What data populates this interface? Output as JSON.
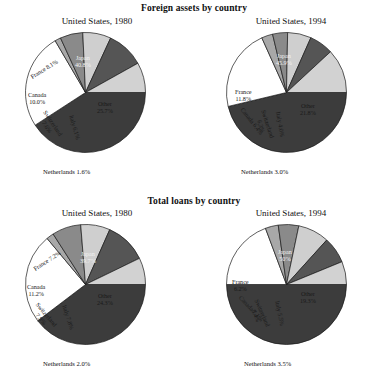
{
  "figure": {
    "panels": [
      {
        "title": "Foreign assets by country",
        "charts": [
          {
            "title": "United States, 1980",
            "netherlands_label": "Netherlands 1.6%"
          },
          {
            "title": "United States, 1994",
            "netherlands_label": "Netherlands 3.0%"
          }
        ]
      },
      {
        "title": "Total loans by country",
        "charts": [
          {
            "title": "United States, 1980",
            "netherlands_label": "Netherlands 2.0%"
          },
          {
            "title": "United States, 1994",
            "netherlands_label": "Netherlands 3.5%"
          }
        ]
      }
    ]
  },
  "colors": {
    "japan": "#3c3c3c",
    "other": "#ffffff",
    "france": "#d2d2d2",
    "canada": "#555555",
    "switzerland": "#cfcfcf",
    "italy": "#8a8a8a",
    "netherlands": "#a8a8a8",
    "stroke": "#1a1a1a",
    "text": "#111111",
    "text_on_dark": "#f2f2f2"
  },
  "chart_data": [
    {
      "type": "pie",
      "title": "United States, 1980",
      "supertitle": "Foreign assets by country",
      "labels": [
        "Japan",
        "Other",
        "Netherlands",
        "Italy",
        "Switzerland",
        "Canada",
        "France"
      ],
      "values": [
        40.8,
        25.7,
        1.6,
        6.1,
        7.6,
        10.0,
        8.1
      ],
      "value_suffix": "%",
      "slice_labels": [
        "Japan\n40.8%",
        "Other\n25.7%",
        "Netherlands 1.6%",
        "Italy 6.1%",
        "Switzerland\n7.6%",
        "Canada\n10.0%",
        "France 8.1%"
      ],
      "legend": "none",
      "start_angle_deg": 0,
      "direction": "clockwise"
    },
    {
      "type": "pie",
      "title": "United States, 1994",
      "supertitle": "Foreign assets by country",
      "labels": [
        "Japan",
        "Other",
        "Netherlands",
        "Italy",
        "Switzerland",
        "Canada",
        "France"
      ],
      "values": [
        45.9,
        21.8,
        3.0,
        4.0,
        6.3,
        6.4,
        11.8
      ],
      "value_suffix": "%",
      "slice_labels": [
        "Japan\n45.9%",
        "Other\n21.8%",
        "Netherlands 3.0%",
        "Italy 4.0%",
        "Switzerland\n6.3%",
        "Canada 6.4%",
        "France\n11.8%"
      ],
      "legend": "none",
      "start_angle_deg": 0,
      "direction": "clockwise"
    },
    {
      "type": "pie",
      "title": "United States, 1980",
      "supertitle": "Total loans by country",
      "labels": [
        "Japan",
        "Other",
        "Netherlands",
        "Italy",
        "Switzerland",
        "Canada",
        "France"
      ],
      "values": [
        39.7,
        24.3,
        2.0,
        7.8,
        7.9,
        11.2,
        7.2
      ],
      "value_suffix": "%",
      "slice_labels": [
        "Japan\n39.7%",
        "Other\n24.3%",
        "Netherlands 2.0%",
        "Italy 7.8%",
        "Switzerland\n7.9%",
        "Canada\n11.2%",
        "France 7.2%"
      ],
      "legend": "none",
      "start_angle_deg": 0,
      "direction": "clockwise"
    },
    {
      "type": "pie",
      "title": "United States, 1994",
      "supertitle": "Total loans by country",
      "labels": [
        "Japan",
        "Other",
        "Netherlands",
        "Italy",
        "Switzerland",
        "Canada",
        "France"
      ],
      "values": [
        50.0,
        19.3,
        3.5,
        5.5,
        8.4,
        7.1,
        6.2
      ],
      "value_suffix": "%",
      "slice_labels": [
        "Japan\n50%",
        "Other\n19.3%",
        "Netherlands 3.5%",
        "Italy 5.5%",
        "Switzerland\n8.4%",
        "Canada 7.1%",
        "France\n6.2%"
      ],
      "legend": "none",
      "start_angle_deg": 0,
      "direction": "clockwise"
    }
  ],
  "labels": {
    "c0": {
      "japan_l1": "Japan",
      "japan_l2": "40.8%",
      "other_l1": "Other",
      "other_l2": "25.7%",
      "france": "France 8.1%",
      "canada_l1": "Canada",
      "canada_l2": "10.0%",
      "switzerland_l1": "Switzerland",
      "switzerland_l2": "7.6%",
      "italy": "Italy 6.1%",
      "netherlands": "Netherlands 1.6%"
    },
    "c1": {
      "japan_l1": "Japan",
      "japan_l2": "45.9%",
      "other_l1": "Other",
      "other_l2": "21.8%",
      "france_l1": "France",
      "france_l2": "11.8%",
      "canada": "Canada 6.4%",
      "switzerland_l1": "Switzerland",
      "switzerland_l2": "6.3%",
      "italy": "Italy 4.0%",
      "netherlands": "Netherlands 3.0%"
    },
    "c2": {
      "japan_l1": "Japan",
      "japan_l2": "39.7%",
      "other_l1": "Other",
      "other_l2": "24.3%",
      "france": "France 7.2%",
      "canada_l1": "Canada",
      "canada_l2": "11.2%",
      "switzerland_l1": "Switzerland",
      "switzerland_l2": "7.9%",
      "italy": "Italy 7.8%",
      "netherlands": "Netherlands 2.0%"
    },
    "c3": {
      "japan_l1": "Japan",
      "japan_l2": "50%",
      "other_l1": "Other",
      "other_l2": "19.3%",
      "france_l1": "France",
      "france_l2": "6.2%",
      "canada": "Canada 7.1%",
      "switzerland_l1": "Switzerland",
      "switzerland_l2": "8.4%",
      "italy": "Italy 5.5%",
      "netherlands": "Netherlands 3.5%"
    }
  }
}
